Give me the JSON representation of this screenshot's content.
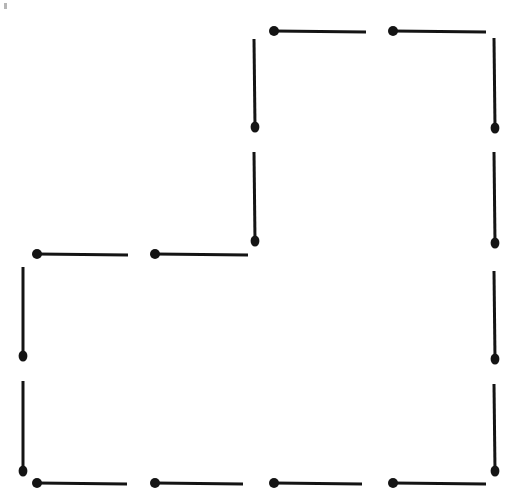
{
  "page": {
    "width": 514,
    "height": 501,
    "background_color": "#ffffff"
  },
  "figure": {
    "name": "matchstick-arrangement",
    "match_color": "#141414",
    "head_color": "#141414",
    "match_count": 16,
    "stick_thickness": 3.0,
    "head_radius_x": 5.0,
    "head_radius_y": 5.6
  },
  "matches": [
    {
      "id": "match-top-row-1",
      "orientation": "horizontal",
      "head_x": 274,
      "head_y": 31,
      "tail_x": 366,
      "tail_y": 32,
      "head_side": "left"
    },
    {
      "id": "match-top-row-2",
      "orientation": "horizontal",
      "head_x": 393,
      "head_y": 31,
      "tail_x": 486,
      "tail_y": 32,
      "head_side": "left"
    },
    {
      "id": "match-middle-column-upper",
      "orientation": "vertical",
      "head_x": 255,
      "head_y": 127,
      "tail_x": 254,
      "tail_y": 39,
      "head_side": "bottom"
    },
    {
      "id": "match-right-column-1",
      "orientation": "vertical",
      "head_x": 495,
      "head_y": 128,
      "tail_x": 494,
      "tail_y": 38,
      "head_side": "bottom"
    },
    {
      "id": "match-middle-column-lower",
      "orientation": "vertical",
      "head_x": 255,
      "head_y": 241,
      "tail_x": 254,
      "tail_y": 152,
      "head_side": "bottom"
    },
    {
      "id": "match-right-column-2",
      "orientation": "vertical",
      "head_x": 495,
      "head_y": 243,
      "tail_x": 494,
      "tail_y": 152,
      "head_side": "bottom"
    },
    {
      "id": "match-middle-row-1",
      "orientation": "horizontal",
      "head_x": 37,
      "head_y": 254,
      "tail_x": 128,
      "tail_y": 255,
      "head_side": "left"
    },
    {
      "id": "match-middle-row-2",
      "orientation": "horizontal",
      "head_x": 155,
      "head_y": 254,
      "tail_x": 248,
      "tail_y": 255,
      "head_side": "left"
    },
    {
      "id": "match-left-column-1",
      "orientation": "vertical",
      "head_x": 23,
      "head_y": 356,
      "tail_x": 23,
      "tail_y": 267,
      "head_side": "bottom"
    },
    {
      "id": "match-right-column-3",
      "orientation": "vertical",
      "head_x": 495,
      "head_y": 359,
      "tail_x": 494,
      "tail_y": 271,
      "head_side": "bottom"
    },
    {
      "id": "match-left-column-2",
      "orientation": "vertical",
      "head_x": 23,
      "head_y": 471,
      "tail_x": 23,
      "tail_y": 381,
      "head_side": "bottom"
    },
    {
      "id": "match-right-column-4",
      "orientation": "vertical",
      "head_x": 495,
      "head_y": 471,
      "tail_x": 494,
      "tail_y": 384,
      "head_side": "bottom"
    },
    {
      "id": "match-bottom-row-1",
      "orientation": "horizontal",
      "head_x": 37,
      "head_y": 483,
      "tail_x": 127,
      "tail_y": 484,
      "head_side": "left"
    },
    {
      "id": "match-bottom-row-2",
      "orientation": "horizontal",
      "head_x": 155,
      "head_y": 483,
      "tail_x": 243,
      "tail_y": 484,
      "head_side": "left"
    },
    {
      "id": "match-bottom-row-3",
      "orientation": "horizontal",
      "head_x": 274,
      "head_y": 483,
      "tail_x": 362,
      "tail_y": 484,
      "head_side": "left"
    },
    {
      "id": "match-bottom-row-4",
      "orientation": "horizontal",
      "head_x": 393,
      "head_y": 483,
      "tail_x": 486,
      "tail_y": 484,
      "head_side": "left"
    }
  ],
  "artifacts": [
    {
      "id": "corner-speck",
      "x": 4,
      "y": 3,
      "width": 3,
      "height": 6,
      "color": "#7a7a7a"
    }
  ]
}
